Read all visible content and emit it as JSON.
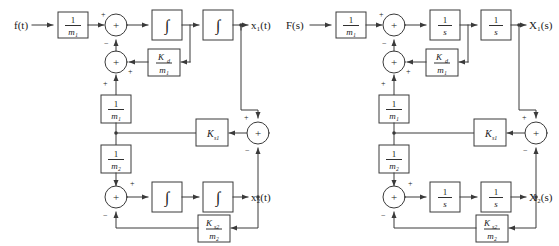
{
  "figure": {
    "type": "block-diagram",
    "background_color": "#ffffff",
    "line_color": "#3a3a3a",
    "text_color": "#1a1a1a"
  },
  "diagrams": [
    {
      "id": "time-domain",
      "input_label": "f(t)",
      "output_label_top": "x₁(t)",
      "output_label_bottom": "x₂(t)",
      "blocks": [
        {
          "id": "gain-input",
          "num": "1",
          "den": "m₁"
        },
        {
          "id": "integrator-1",
          "symbol": "∫"
        },
        {
          "id": "integrator-2",
          "symbol": "∫"
        },
        {
          "id": "damper-gain",
          "num": "K",
          "num_sub": "d",
          "den": "m₁"
        },
        {
          "id": "mass1-gain",
          "num": "1",
          "den": "m₁"
        },
        {
          "id": "mass2-gain",
          "num": "1",
          "den": "m₂"
        },
        {
          "id": "spring-gain",
          "label": "K",
          "label_sub": "s1"
        },
        {
          "id": "integrator-3",
          "symbol": "∫"
        },
        {
          "id": "integrator-4",
          "symbol": "∫"
        },
        {
          "id": "spring2-gain",
          "num": "K",
          "num_sub": "s2",
          "den": "m₂"
        }
      ],
      "summing_junctions": [
        {
          "id": "sum-top",
          "glyph": "+",
          "signs": {
            "left": "+",
            "bottom": "−"
          }
        },
        {
          "id": "sum-mid",
          "glyph": "+",
          "signs": {
            "right": "+",
            "bottom": "+"
          }
        },
        {
          "id": "sum-right",
          "glyph": "+",
          "signs": {
            "top": "+",
            "bottom": "−"
          }
        },
        {
          "id": "sum-bottom",
          "glyph": "+",
          "signs": {
            "top": "+",
            "bottom": "−"
          }
        }
      ]
    },
    {
      "id": "laplace-domain",
      "input_label": "F(s)",
      "output_label_top": "X₁(s)",
      "output_label_bottom": "X₂(s)",
      "blocks": [
        {
          "id": "gain-input",
          "num": "1",
          "den": "m₁"
        },
        {
          "id": "integrator-1",
          "num": "1",
          "den": "s"
        },
        {
          "id": "integrator-2",
          "num": "1",
          "den": "s"
        },
        {
          "id": "damper-gain",
          "num": "K",
          "num_sub": "d",
          "den": "m₁"
        },
        {
          "id": "mass1-gain",
          "num": "1",
          "den": "m₁"
        },
        {
          "id": "mass2-gain",
          "num": "1",
          "den": "m₂"
        },
        {
          "id": "spring-gain",
          "label": "K",
          "label_sub": "s1"
        },
        {
          "id": "integrator-3",
          "num": "1",
          "den": "s"
        },
        {
          "id": "integrator-4",
          "num": "1",
          "den": "s"
        },
        {
          "id": "spring2-gain",
          "num": "K",
          "num_sub": "s2",
          "den": "m₂"
        }
      ],
      "summing_junctions": [
        {
          "id": "sum-top",
          "glyph": "+",
          "signs": {
            "left": "+",
            "bottom": "−"
          }
        },
        {
          "id": "sum-mid",
          "glyph": "+",
          "signs": {
            "right": "+",
            "bottom": "+"
          }
        },
        {
          "id": "sum-right",
          "glyph": "+",
          "signs": {
            "top": "+",
            "bottom": "−"
          }
        },
        {
          "id": "sum-bottom",
          "glyph": "+",
          "signs": {
            "top": "+",
            "bottom": "−"
          }
        }
      ]
    }
  ]
}
